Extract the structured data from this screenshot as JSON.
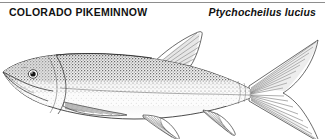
{
  "header": {
    "common_name": "COLORADO PIKEMINNOW",
    "scientific_name": "Ptychocheilus lucius"
  },
  "illustration": {
    "subject": "colorado-pikeminnow-fish",
    "caption": "",
    "orientation": "left-facing",
    "style": "stippled pen-and-ink line drawing",
    "parts": [
      "snout",
      "mouth",
      "eye",
      "operculum",
      "lateral-line",
      "dorsal-fin",
      "pectoral-fin",
      "pelvic-fin",
      "anal-fin",
      "caudal-fin"
    ]
  },
  "colors": {
    "background": "#ffffff",
    "ink": "#2b2b2b",
    "rule": "#8e8e8e",
    "shading_light": "#d8d8d8",
    "shading_mid": "#a8a8a8",
    "shading_dark": "#6f6f6f",
    "text": "#111111"
  }
}
